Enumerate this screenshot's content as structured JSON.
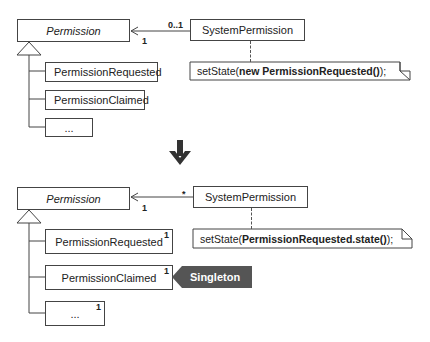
{
  "top": {
    "permission": "Permission",
    "system_permission": "SystemPermission",
    "mult_near": "0..1",
    "mult_far": "1",
    "subclasses": [
      "PermissionRequested",
      "PermissionClaimed",
      "..."
    ],
    "note": {
      "prefix": "setState(",
      "bold": "new PermissionRequested()",
      "suffix": ");"
    }
  },
  "arrow": "down-arrow",
  "bottom": {
    "permission": "Permission",
    "system_permission": "SystemPermission",
    "mult_near": "*",
    "mult_far": "1",
    "subclasses": [
      "PermissionRequested",
      "PermissionClaimed",
      "..."
    ],
    "subclass_mult": "1",
    "note": {
      "prefix": "setState(",
      "bold": "PermissionRequested.state()",
      "suffix": ");"
    },
    "singleton_label": "Singleton"
  }
}
